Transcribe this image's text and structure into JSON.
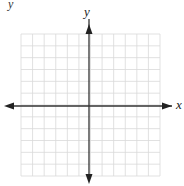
{
  "chart_data": {
    "type": "coordinate-grid",
    "title": "",
    "xlabel": "x",
    "ylabel": "y",
    "grid": true,
    "grid_columns": 12,
    "grid_rows": 12,
    "grid_color": "#d9d9d9",
    "axis_color": "#333333",
    "x_ticks": [],
    "y_ticks": [],
    "series": [],
    "axis_arrows": [
      "left",
      "right",
      "up",
      "down"
    ],
    "origin_px": [
      89,
      106
    ],
    "grid_bounds_px": {
      "left": 21,
      "right": 160,
      "top": 34,
      "bottom": 176
    }
  },
  "corner_fragment": "y"
}
